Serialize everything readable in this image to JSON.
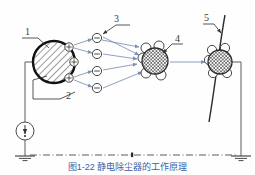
{
  "figure": {
    "title": "静电除尘器的工作原理",
    "caption": "图1-22  静电除尘器的工作原理",
    "type": "schematic-diagram"
  },
  "colors": {
    "outline": "#2b2b2b",
    "wire": "#5a5a5a",
    "arrow": "#7b90b5",
    "caption": "#3b5ea8",
    "hatch": "#4a4a4a",
    "white": "#ffffff"
  },
  "callouts": [
    {
      "id": "1",
      "label": "1",
      "target": "corona-electrode",
      "x": 27,
      "y": 32
    },
    {
      "id": "2",
      "label": "2",
      "target": "negative-ion",
      "x": 68,
      "y": 95
    },
    {
      "id": "3",
      "label": "3",
      "target": "ion-stream",
      "x": 115,
      "y": 24
    },
    {
      "id": "4",
      "label": "4",
      "target": "charged-dust-particle",
      "x": 176,
      "y": 44
    },
    {
      "id": "5",
      "label": "5",
      "target": "collecting-plate",
      "x": 205,
      "y": 18
    }
  ],
  "electrode": {
    "name": "corona-electrode",
    "cx": 54,
    "cy": 62,
    "r": 21,
    "fill": "diagonal-hatch"
  },
  "positive_ions": [
    {
      "symbol": "+",
      "cx": 69,
      "cy": 47,
      "r": 4.2
    },
    {
      "symbol": "+",
      "cx": 74,
      "cy": 62,
      "r": 4.2
    },
    {
      "symbol": "+",
      "cx": 69,
      "cy": 78,
      "r": 4.2
    }
  ],
  "negative_ions": [
    {
      "symbol": "−",
      "cx": 97,
      "cy": 38,
      "r": 4.6
    },
    {
      "symbol": "−",
      "cx": 97,
      "cy": 54,
      "r": 4.6
    },
    {
      "symbol": "−",
      "cx": 97,
      "cy": 71,
      "r": 4.6
    },
    {
      "symbol": "−",
      "cx": 97,
      "cy": 88,
      "r": 4.6
    }
  ],
  "dust_particles": [
    {
      "name": "mid-charged-particle",
      "cx": 155,
      "cy": 61,
      "r": 13,
      "fill": "cross-hatch",
      "satellites": [
        {
          "cx": 146,
          "cy": 48,
          "r": 5
        },
        {
          "cx": 159,
          "cy": 46,
          "r": 5
        },
        {
          "cx": 143,
          "cy": 58,
          "r": 5
        },
        {
          "cx": 146,
          "cy": 73,
          "r": 5
        },
        {
          "cx": 161,
          "cy": 75,
          "r": 5
        }
      ]
    },
    {
      "name": "collected-particle",
      "cx": 220,
      "cy": 62,
      "r": 12,
      "fill": "cross-hatch",
      "satellites": [
        {
          "cx": 212,
          "cy": 50,
          "r": 4.6
        },
        {
          "cx": 225,
          "cy": 48,
          "r": 4.6
        },
        {
          "cx": 209,
          "cy": 60,
          "r": 4.6
        },
        {
          "cx": 213,
          "cy": 73,
          "r": 4.6
        },
        {
          "cx": 227,
          "cy": 73,
          "r": 4.6
        }
      ]
    }
  ],
  "source": {
    "name": "hv-dc-source",
    "cx": 25,
    "cy": 131,
    "r": 9,
    "symbol": "dc-arrow"
  },
  "grounds": [
    {
      "name": "ground-left",
      "x": 25,
      "y": 156
    },
    {
      "name": "ground-right",
      "x": 240,
      "y": 156
    }
  ],
  "centerline": {
    "name": "centerline",
    "y": 155,
    "x1": 28,
    "x2": 238,
    "style": "dash-dot"
  },
  "collecting_plate": {
    "name": "collecting-plate",
    "description": "curved grounded collecting plate"
  },
  "arrows": {
    "name": "ion-migration-arrows",
    "count": 11,
    "direction": "left-to-right"
  }
}
